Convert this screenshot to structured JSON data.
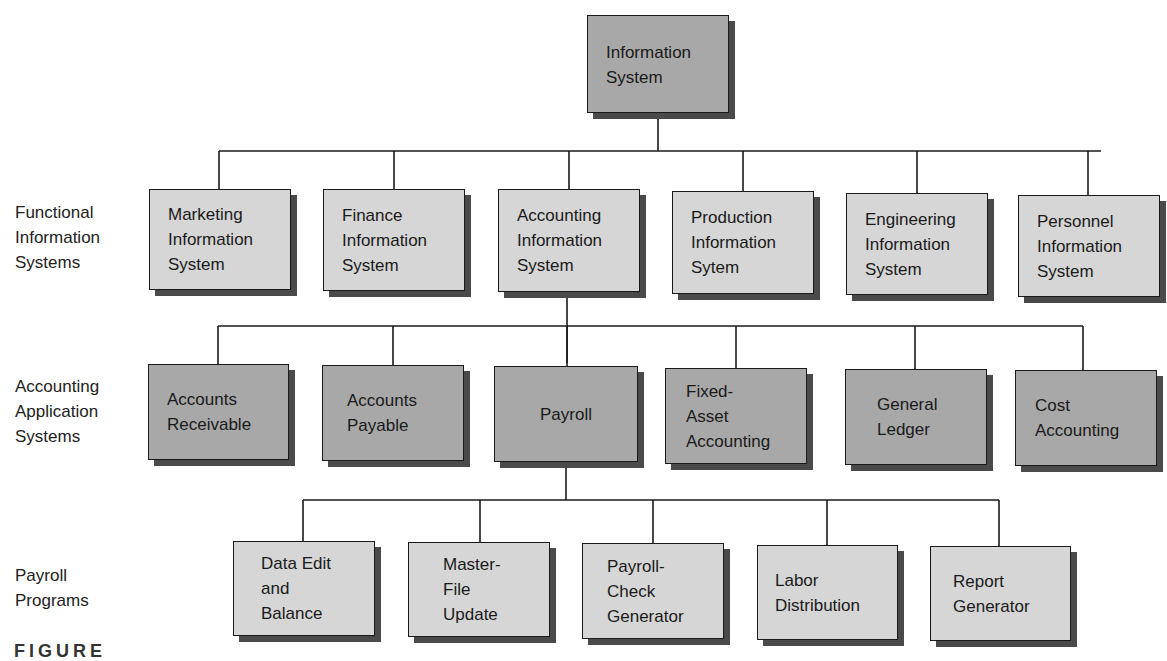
{
  "diagram": {
    "type": "hierarchy",
    "root": {
      "label_lines": [
        "Information",
        "System"
      ]
    },
    "row_labels": [
      {
        "lines": [
          "Functional",
          "Information",
          "Systems"
        ]
      },
      {
        "lines": [
          "Accounting",
          "Application",
          "Systems"
        ]
      },
      {
        "lines": [
          "Payroll",
          "Programs"
        ]
      }
    ],
    "functional_systems": [
      {
        "lines": [
          "Marketing",
          "Information",
          "System"
        ]
      },
      {
        "lines": [
          "Finance",
          "Information",
          "System"
        ]
      },
      {
        "lines": [
          "Accounting",
          "Information",
          "System"
        ]
      },
      {
        "lines": [
          "Production",
          "Information",
          "Sytem"
        ]
      },
      {
        "lines": [
          "Engineering",
          "Information",
          "System"
        ]
      },
      {
        "lines": [
          "Personnel",
          "Information",
          "System"
        ]
      }
    ],
    "accounting_applications": [
      {
        "lines": [
          "Accounts",
          "Receivable"
        ]
      },
      {
        "lines": [
          "Accounts",
          "Payable"
        ]
      },
      {
        "lines": [
          "Payroll"
        ]
      },
      {
        "lines": [
          "Fixed-",
          "Asset",
          "Accounting"
        ]
      },
      {
        "lines": [
          "General",
          "Ledger"
        ]
      },
      {
        "lines": [
          "Cost",
          "Accounting"
        ]
      }
    ],
    "payroll_programs": [
      {
        "lines": [
          "Data Edit",
          "and",
          "Balance"
        ]
      },
      {
        "lines": [
          "Master-",
          "File",
          "Update"
        ]
      },
      {
        "lines": [
          "Payroll-",
          "Check",
          "Generator"
        ]
      },
      {
        "lines": [
          "Labor",
          "Distribution"
        ]
      },
      {
        "lines": [
          "Report",
          "Generator"
        ]
      }
    ],
    "caption_fragment": "FIGURE"
  },
  "colors": {
    "light_box": "#d6d6d6",
    "dark_box": "#a8a8a8",
    "line": "#1a1a1a",
    "shadow": "#4a4a4a"
  }
}
